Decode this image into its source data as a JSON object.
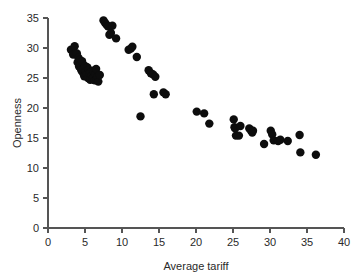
{
  "chart_data": {
    "type": "scatter",
    "title": "",
    "subtitle": "",
    "xlabel": "Average tariff",
    "ylabel": "Openness",
    "xlim": [
      0,
      40
    ],
    "ylim": [
      0,
      35
    ],
    "xticks": [
      0,
      5,
      10,
      15,
      20,
      25,
      30,
      35,
      40
    ],
    "yticks": [
      0,
      5,
      10,
      15,
      20,
      25,
      30,
      35
    ],
    "grid": false,
    "legend": null,
    "marker": {
      "shape": "circle",
      "color": "#0d0d0d",
      "size": 5.2
    },
    "annotations": [],
    "series": [
      {
        "name": "countries",
        "color": "#0d0d0d",
        "points": [
          [
            3.1,
            29.7
          ],
          [
            3.4,
            28.9
          ],
          [
            3.6,
            30.3
          ],
          [
            3.9,
            29.1
          ],
          [
            4.0,
            27.6
          ],
          [
            4.1,
            28.4
          ],
          [
            4.2,
            26.9
          ],
          [
            4.3,
            28.0
          ],
          [
            4.4,
            27.2
          ],
          [
            4.5,
            26.3
          ],
          [
            4.6,
            27.8
          ],
          [
            4.7,
            25.9
          ],
          [
            4.8,
            26.6
          ],
          [
            4.9,
            25.3
          ],
          [
            5.0,
            27.0
          ],
          [
            5.1,
            26.1
          ],
          [
            5.2,
            25.6
          ],
          [
            5.3,
            26.8
          ],
          [
            5.4,
            25.0
          ],
          [
            5.5,
            26.4
          ],
          [
            5.6,
            25.8
          ],
          [
            5.7,
            24.7
          ],
          [
            5.8,
            26.0
          ],
          [
            5.9,
            25.4
          ],
          [
            6.0,
            24.9
          ],
          [
            6.1,
            26.2
          ],
          [
            6.2,
            25.1
          ],
          [
            6.3,
            24.6
          ],
          [
            6.4,
            25.7
          ],
          [
            6.5,
            26.5
          ],
          [
            6.6,
            24.8
          ],
          [
            6.7,
            25.2
          ],
          [
            6.8,
            24.4
          ],
          [
            7.0,
            25.5
          ],
          [
            7.5,
            34.6
          ],
          [
            7.7,
            34.2
          ],
          [
            7.9,
            33.9
          ],
          [
            8.1,
            33.6
          ],
          [
            8.3,
            32.2
          ],
          [
            8.5,
            32.5
          ],
          [
            8.7,
            33.7
          ],
          [
            9.2,
            31.6
          ],
          [
            10.9,
            29.7
          ],
          [
            11.2,
            29.9
          ],
          [
            11.4,
            30.2
          ],
          [
            12.0,
            28.5
          ],
          [
            12.5,
            18.6
          ],
          [
            13.6,
            26.3
          ],
          [
            13.9,
            25.8
          ],
          [
            14.2,
            25.6
          ],
          [
            14.5,
            25.2
          ],
          [
            14.3,
            22.3
          ],
          [
            15.6,
            22.6
          ],
          [
            15.9,
            22.3
          ],
          [
            20.1,
            19.4
          ],
          [
            21.1,
            19.1
          ],
          [
            21.8,
            17.4
          ],
          [
            25.1,
            18.1
          ],
          [
            25.2,
            16.8
          ],
          [
            25.3,
            16.6
          ],
          [
            25.4,
            15.4
          ],
          [
            25.8,
            15.4
          ],
          [
            26.0,
            17.0
          ],
          [
            27.2,
            16.6
          ],
          [
            27.4,
            16.3
          ],
          [
            27.6,
            15.9
          ],
          [
            27.7,
            16.2
          ],
          [
            29.2,
            14.0
          ],
          [
            30.1,
            16.2
          ],
          [
            30.3,
            15.6
          ],
          [
            30.5,
            14.6
          ],
          [
            31.1,
            14.5
          ],
          [
            31.4,
            14.7
          ],
          [
            32.4,
            14.5
          ],
          [
            34.0,
            15.5
          ],
          [
            34.1,
            12.6
          ],
          [
            36.2,
            12.2
          ]
        ]
      }
    ]
  },
  "axes": {
    "x_title": "Average tariff",
    "y_title": "Openness",
    "x_tick_labels": [
      "0",
      "5",
      "10",
      "15",
      "20",
      "25",
      "30",
      "35",
      "40"
    ],
    "y_tick_labels": [
      "0",
      "5",
      "10",
      "15",
      "20",
      "25",
      "30",
      "35"
    ]
  },
  "colors": {
    "marker": "#0d0d0d",
    "axis": "#555555",
    "text": "#2a2a2a",
    "background": "#ffffff"
  }
}
